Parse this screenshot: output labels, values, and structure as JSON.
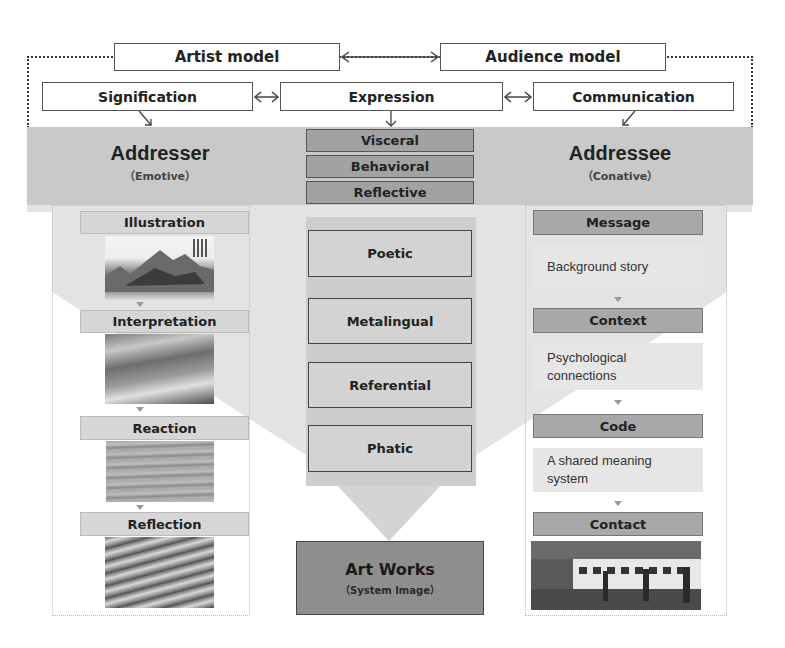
{
  "top": {
    "artist_model": "Artist  model",
    "audience_model": "Audience  model",
    "signification": "Signification",
    "expression": "Expression",
    "communication": "Communication"
  },
  "band": {
    "addresser": {
      "title": "Addresser",
      "subtitle": "（Emotive）"
    },
    "addressee": {
      "title": "Addressee",
      "subtitle": "（Conative）"
    },
    "design_levels": [
      "Visceral",
      "Behavioral",
      "Reflective"
    ]
  },
  "left_column": {
    "steps": [
      {
        "label": "Illustration",
        "image": "landscape-painting"
      },
      {
        "label": "Interpretation",
        "image": "misty-sky-painting"
      },
      {
        "label": "Reaction",
        "image": "water-texture"
      },
      {
        "label": "Reflection",
        "image": "wave-texture"
      }
    ]
  },
  "center_column": {
    "functions": [
      "Poetic",
      "Metalingual",
      "Referential",
      "Phatic"
    ],
    "art_works": {
      "title": "Art Works",
      "subtitle": "（System Image）"
    }
  },
  "right_column": {
    "steps": [
      {
        "label": "Message",
        "description": "Background story"
      },
      {
        "label": "Context",
        "description": "Psychological connections"
      },
      {
        "label": "Code",
        "description": "A shared meaning system"
      },
      {
        "label": "Contact",
        "image": "gallery-photo"
      }
    ]
  },
  "colors": {
    "band_gray": "#c9c9c9",
    "funnel_gray": "#e3e3e3",
    "dark_box": "#a2a2a2",
    "art_works": "#8e8e8e"
  }
}
